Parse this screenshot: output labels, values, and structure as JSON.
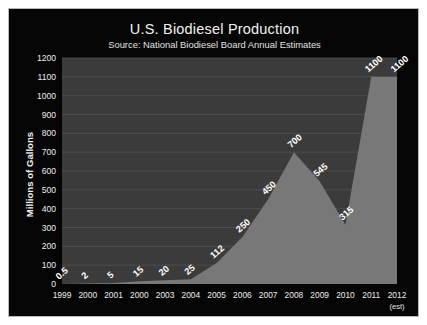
{
  "figure": {
    "title": "U.S. Biodiesel Production",
    "subtitle": "Source: National Biodiesel Board Annual Estimates",
    "y_axis_title": "Millions of Gallons",
    "border_color": "#b9b9b9",
    "background_color": "#050505",
    "plot_background_color": "#3b3b3b",
    "area_fill_color": "#787878",
    "gridline_color": "#525252",
    "label_color": "#ffffff"
  },
  "chart_data": {
    "type": "area",
    "title": "U.S. Biodiesel Production",
    "subtitle": "Source: National Biodiesel Board Annual Estimates",
    "xlabel": "",
    "ylabel": "Millions of Gallons",
    "ylim": [
      0,
      1200
    ],
    "ytick_step": 100,
    "grid": true,
    "legend": "none",
    "categories": [
      "1999",
      "2000",
      "2001",
      "2000",
      "2003",
      "2004",
      "2005",
      "2006",
      "2007",
      "2008",
      "2009",
      "2010",
      "2011",
      "2012"
    ],
    "category_sublabels": [
      "",
      "",
      "",
      "",
      "",
      "",
      "",
      "",
      "",
      "",
      "",
      "",
      "",
      "(est)"
    ],
    "values": [
      0.5,
      2,
      5,
      15,
      20,
      25,
      112,
      250,
      450,
      700,
      545,
      315,
      1100,
      1100
    ],
    "data_labels": [
      "0.5",
      "2",
      "5",
      "15",
      "20",
      "25",
      "112",
      "250",
      "450",
      "700",
      "545",
      "315",
      "1100",
      "1100"
    ],
    "ytick_labels": [
      "0",
      "100",
      "200",
      "300",
      "400",
      "500",
      "600",
      "700",
      "800",
      "900",
      "1000",
      "1100",
      "1200"
    ],
    "ytick_values": [
      0,
      100,
      200,
      300,
      400,
      500,
      600,
      700,
      800,
      900,
      1000,
      1100,
      1200
    ]
  }
}
